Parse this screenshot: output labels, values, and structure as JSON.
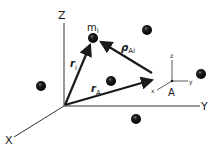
{
  "diagram": {
    "title": "",
    "colors": {
      "background": "#ffffff",
      "ink": "#1a1a1a",
      "axis": "#333333"
    },
    "global_axes": {
      "origin": [
        64,
        106
      ],
      "z_label": "Z",
      "y_label": "Y",
      "x_label": "X"
    },
    "local_frame": {
      "origin_label": "A",
      "z_label": "z",
      "y_label": "y",
      "x_label": "x"
    },
    "vectors": [
      {
        "id": "r_i",
        "symbol": "r",
        "subscript": "i",
        "from": "origin",
        "to": "m_i"
      },
      {
        "id": "r_A",
        "symbol": "r",
        "subscript": "A",
        "from": "origin",
        "to": "A"
      },
      {
        "id": "rho_Ai",
        "symbol": "ρ",
        "subscript": "Ai",
        "from": "A",
        "to": "m_i"
      }
    ],
    "masses": [
      {
        "label": "m",
        "subscript": "i",
        "highlighted": true
      },
      {
        "label": ""
      },
      {
        "label": ""
      },
      {
        "label": ""
      },
      {
        "label": ""
      },
      {
        "label": ""
      }
    ]
  }
}
